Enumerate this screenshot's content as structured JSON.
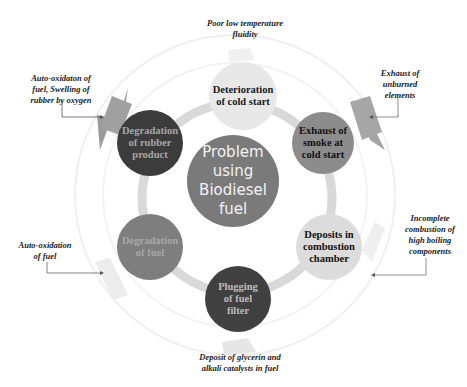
{
  "diagram": {
    "center": {
      "label": "Problem using Biodiesel fuel",
      "lines": [
        "Problem",
        "using",
        "Biodiesel",
        "fuel"
      ],
      "color": "#7a7a7a"
    },
    "nodes": [
      {
        "id": "deterioration",
        "lines": [
          "Deterioration",
          "of cold start"
        ],
        "color": "#e6e6e6",
        "text_color": "#1a1a1a"
      },
      {
        "id": "exhaust-smoke",
        "lines": [
          "Exhaust of",
          "smoke at",
          "cold start"
        ],
        "color": "#8c8c8c",
        "text_color": "#111111"
      },
      {
        "id": "deposits",
        "lines": [
          "Deposits in",
          "combustion",
          "chamber"
        ],
        "color": "#d9d9d9",
        "text_color": "#111111"
      },
      {
        "id": "plugging",
        "lines": [
          "Plugging",
          "of fuel",
          "filter"
        ],
        "color": "#404040",
        "text_color": "#bdbdbd"
      },
      {
        "id": "degradation-fuel",
        "lines": [
          "Degradation",
          "of fuel"
        ],
        "color": "#7e7e7e",
        "text_color": "#a8a8a8"
      },
      {
        "id": "degradation-rubber",
        "lines": [
          "Degradation",
          "of rubber",
          "product"
        ],
        "color": "#3c3c3c",
        "text_color": "#a6a6a6"
      }
    ],
    "causes": [
      {
        "id": "top",
        "lines": [
          "Poor low temperature",
          "fluidity"
        ]
      },
      {
        "id": "top-left",
        "lines": [
          "Auto-oxidaton of",
          "fuel, Swelling of",
          "rubber by oxygen"
        ]
      },
      {
        "id": "top-right",
        "lines": [
          "Exhaust of",
          "unburned",
          "elements"
        ]
      },
      {
        "id": "right",
        "lines": [
          "Incomplete",
          "combustion of",
          "high boiling",
          "components"
        ]
      },
      {
        "id": "left",
        "lines": [
          "Auto-oxidation",
          "of fuel"
        ]
      },
      {
        "id": "bottom",
        "lines": [
          "Deposit of glycerin and",
          "alkali catalysts in fuel"
        ]
      }
    ],
    "colors": {
      "ring": "#d9d9d9",
      "arrow": "#555555",
      "outer_ring": "#ededed"
    }
  }
}
